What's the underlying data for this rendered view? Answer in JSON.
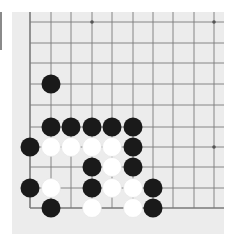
{
  "board": {
    "type": "go-board-fragment",
    "background": "#ececec",
    "line_color": "#7a7a7a",
    "columns_x": [
      30,
      51,
      71,
      92,
      112,
      133,
      153,
      173,
      194,
      214
    ],
    "rows_y": [
      22,
      43,
      63,
      84,
      105,
      127,
      147,
      167,
      188,
      208
    ],
    "left_edge": true,
    "bottom_edge": true,
    "star_points": [
      [
        3,
        0
      ],
      [
        9,
        0
      ],
      [
        9,
        6
      ]
    ],
    "stone_radius": 9.5,
    "colors": {
      "black": "#1a1a1a",
      "white": "#ffffff"
    },
    "stones": [
      {
        "color": "black",
        "col": 1,
        "row": 3
      },
      {
        "color": "black",
        "col": 1,
        "row": 5
      },
      {
        "color": "black",
        "col": 2,
        "row": 5
      },
      {
        "color": "black",
        "col": 3,
        "row": 5
      },
      {
        "color": "black",
        "col": 4,
        "row": 5
      },
      {
        "color": "black",
        "col": 5,
        "row": 5
      },
      {
        "color": "black",
        "col": 0,
        "row": 6
      },
      {
        "color": "white",
        "col": 1,
        "row": 6
      },
      {
        "color": "white",
        "col": 2,
        "row": 6
      },
      {
        "color": "white",
        "col": 3,
        "row": 6
      },
      {
        "color": "white",
        "col": 4,
        "row": 6
      },
      {
        "color": "black",
        "col": 5,
        "row": 6
      },
      {
        "color": "black",
        "col": 3,
        "row": 7
      },
      {
        "color": "white",
        "col": 4,
        "row": 7
      },
      {
        "color": "black",
        "col": 5,
        "row": 7
      },
      {
        "color": "black",
        "col": 0,
        "row": 8
      },
      {
        "color": "white",
        "col": 1,
        "row": 8
      },
      {
        "color": "black",
        "col": 3,
        "row": 8
      },
      {
        "color": "white",
        "col": 4,
        "row": 8
      },
      {
        "color": "white",
        "col": 5,
        "row": 8
      },
      {
        "color": "black",
        "col": 6,
        "row": 8
      },
      {
        "color": "black",
        "col": 1,
        "row": 9
      },
      {
        "color": "white",
        "col": 3,
        "row": 9
      },
      {
        "color": "white",
        "col": 5,
        "row": 9
      },
      {
        "color": "black",
        "col": 6,
        "row": 9
      }
    ]
  }
}
